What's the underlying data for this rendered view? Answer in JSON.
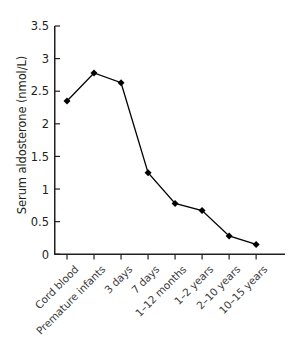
{
  "chart_data": {
    "type": "line",
    "title": "",
    "xlabel": "",
    "ylabel": "Serum aldosterone (nmol/L)",
    "categories": [
      "Cord blood",
      "Premature infants",
      "3 days",
      "7 days",
      "1–12 months",
      "1–2 years",
      "2–10 years",
      "10–15 years"
    ],
    "values": [
      2.35,
      2.78,
      2.63,
      1.25,
      0.78,
      0.67,
      0.28,
      0.15
    ],
    "ylim": [
      0,
      3.5
    ],
    "y_ticks": [
      "0",
      "0.5",
      "1",
      "1.5",
      "2",
      "2.5",
      "3",
      "3.5"
    ],
    "y_tick_values": [
      0,
      0.5,
      1,
      1.5,
      2,
      2.5,
      3,
      3.5
    ],
    "grid": false,
    "legend": "none",
    "marker": "diamond",
    "series_color": "#000000",
    "axis_color": "#231f20",
    "text_color": "#231f20"
  }
}
